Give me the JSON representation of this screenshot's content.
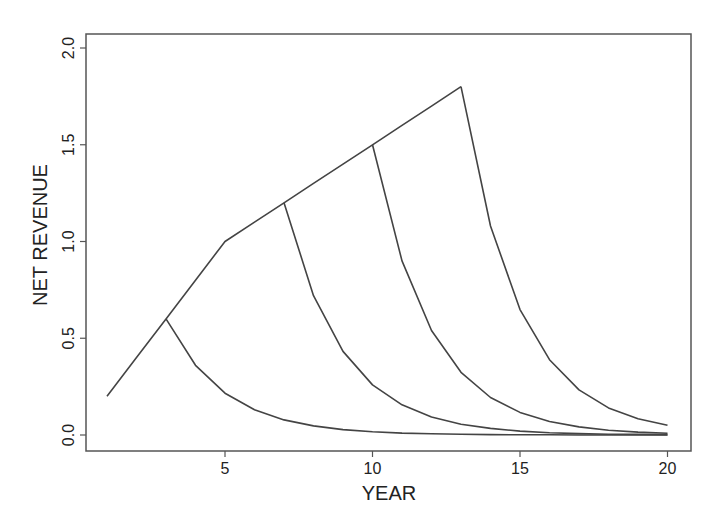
{
  "chart_data": {
    "type": "line",
    "title": "",
    "xlabel": "YEAR",
    "ylabel": "NET REVENUE",
    "xlim": [
      0.3,
      21.0
    ],
    "ylim": [
      -0.08,
      2.07
    ],
    "x_ticks": [
      5,
      10,
      15,
      20
    ],
    "x_tick_labels": [
      "5",
      "10",
      "15",
      "20"
    ],
    "y_ticks": [
      0.0,
      0.5,
      1.0,
      1.5,
      2.0
    ],
    "y_tick_labels": [
      "0.0",
      "0.5",
      "1.0",
      "1.5",
      "2.0"
    ],
    "grid": false,
    "legend": null,
    "line_color": "#444444",
    "series": [
      {
        "name": "growth envelope",
        "x": [
          1,
          2,
          3,
          4,
          5,
          6,
          7,
          8,
          9,
          10,
          11,
          12,
          13
        ],
        "values": [
          0.2,
          0.4,
          0.6,
          0.8,
          1.0,
          1.1,
          1.2,
          1.3,
          1.4,
          1.5,
          1.6,
          1.7,
          1.8
        ]
      },
      {
        "name": "harvest at year 3",
        "x": [
          3,
          4,
          5,
          6,
          7,
          8,
          9,
          10,
          11,
          12,
          13,
          14,
          15,
          16,
          17,
          18,
          19,
          20
        ],
        "values": [
          0.6,
          0.36,
          0.216,
          0.13,
          0.078,
          0.047,
          0.028,
          0.017,
          0.01,
          0.006,
          0.004,
          0.002,
          0.001,
          0.001,
          0.0,
          0.0,
          0.0,
          0.0
        ]
      },
      {
        "name": "harvest at year 7",
        "x": [
          7,
          8,
          9,
          10,
          11,
          12,
          13,
          14,
          15,
          16,
          17,
          18,
          19,
          20
        ],
        "values": [
          1.2,
          0.72,
          0.432,
          0.259,
          0.156,
          0.093,
          0.056,
          0.034,
          0.02,
          0.012,
          0.007,
          0.004,
          0.003,
          0.002
        ]
      },
      {
        "name": "harvest at year 10",
        "x": [
          10,
          11,
          12,
          13,
          14,
          15,
          16,
          17,
          18,
          19,
          20
        ],
        "values": [
          1.5,
          0.9,
          0.54,
          0.324,
          0.194,
          0.117,
          0.07,
          0.042,
          0.025,
          0.015,
          0.009
        ]
      },
      {
        "name": "harvest at year 13",
        "x": [
          13,
          14,
          15,
          16,
          17,
          18,
          19,
          20
        ],
        "values": [
          1.8,
          1.08,
          0.648,
          0.389,
          0.233,
          0.14,
          0.084,
          0.05
        ]
      }
    ]
  }
}
